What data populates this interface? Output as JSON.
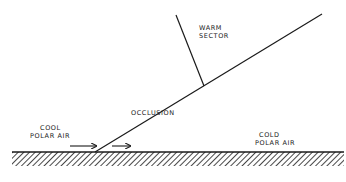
{
  "diagram": {
    "labels": {
      "warm_sector": [
        "Warm",
        "Sector"
      ],
      "occlusion": "Occlusion",
      "cool_polar_air": [
        "Cool",
        "Polar Air"
      ],
      "cold_polar_air": [
        "Cold",
        "Polar Air"
      ]
    },
    "colors": {
      "line": "#1a1a1a",
      "background": "#ffffff"
    },
    "geometry": {
      "ground_y": 152,
      "ground_x_start": 12,
      "ground_x_end": 344,
      "occlusion_line": {
        "x1": 95,
        "y1": 152,
        "x2": 322,
        "y2": 14
      },
      "warm_front_line": {
        "x1": 176,
        "y1": 15,
        "x2": 204,
        "y2": 86
      },
      "arrows": [
        {
          "x1": 70,
          "x2": 96,
          "y": 146
        },
        {
          "x1": 112,
          "x2": 130,
          "y": 146
        }
      ]
    }
  }
}
